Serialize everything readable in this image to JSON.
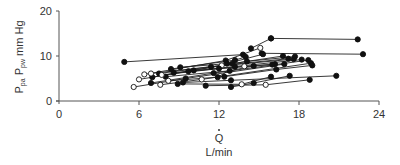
{
  "chart_data": {
    "type": "line",
    "title": "",
    "xlabel": "Q̇ L/min",
    "xlabel_symbol": "Q",
    "xlabel_unit": "L/min",
    "ylabel": "Ppa Ppw mm Hg",
    "ylabel_parts": {
      "p1": "P",
      "s1": "pa",
      "p2": " P",
      "s2": "pw",
      "unit": " mm Hg"
    },
    "xlim": [
      0,
      24
    ],
    "ylim": [
      0,
      20
    ],
    "xticks": [
      0,
      6,
      12,
      18,
      24
    ],
    "yticks": [
      0,
      10,
      20
    ],
    "grid": false,
    "legend": null,
    "marker_styles": {
      "filled": "#111111",
      "open": "#ffffff"
    },
    "series": [
      {
        "name": "subject-1",
        "points": [
          [
            4.9,
            8.7,
            "f"
          ],
          [
            13.8,
            10.3,
            "f"
          ]
        ]
      },
      {
        "name": "subject-2",
        "points": [
          [
            15.9,
            13.9,
            "f"
          ],
          [
            22.4,
            13.7,
            "f"
          ]
        ]
      },
      {
        "name": "subject-3",
        "points": [
          [
            14.4,
            11.7,
            "f"
          ],
          [
            15.9,
            13.9,
            "f"
          ]
        ]
      },
      {
        "name": "subject-4",
        "points": [
          [
            15.2,
            10.6,
            "f"
          ],
          [
            22.8,
            10.4,
            "f"
          ]
        ]
      },
      {
        "name": "subject-5",
        "points": [
          [
            6.4,
            5.9,
            "o"
          ],
          [
            12.5,
            9.0,
            "f"
          ],
          [
            15.1,
            11.8,
            "o"
          ]
        ]
      },
      {
        "name": "subject-6",
        "points": [
          [
            7.0,
            5.3,
            "f"
          ],
          [
            13.0,
            8.3,
            "f"
          ],
          [
            16.8,
            10.0,
            "f"
          ]
        ]
      },
      {
        "name": "subject-7",
        "points": [
          [
            6.9,
            6.1,
            "o"
          ],
          [
            12.2,
            7.9,
            "o"
          ],
          [
            17.2,
            9.4,
            "f"
          ]
        ]
      },
      {
        "name": "subject-8",
        "points": [
          [
            7.5,
            6.1,
            "f"
          ],
          [
            11.4,
            7.6,
            "f"
          ],
          [
            17.6,
            9.3,
            "f"
          ]
        ]
      },
      {
        "name": "subject-9",
        "points": [
          [
            6.0,
            4.8,
            "o"
          ],
          [
            9.7,
            6.6,
            "f"
          ],
          [
            18.2,
            9.2,
            "f"
          ]
        ]
      },
      {
        "name": "subject-10",
        "points": [
          [
            5.6,
            3.1,
            "o"
          ],
          [
            9.5,
            5.0,
            "f"
          ],
          [
            16.9,
            8.2,
            "f"
          ]
        ]
      },
      {
        "name": "subject-11",
        "points": [
          [
            6.9,
            4.0,
            "f"
          ],
          [
            11.6,
            6.2,
            "f"
          ],
          [
            18.7,
            9.1,
            "f"
          ]
        ]
      },
      {
        "name": "subject-12",
        "points": [
          [
            7.6,
            3.6,
            "o"
          ],
          [
            10.7,
            4.8,
            "o"
          ],
          [
            18.9,
            8.4,
            "f"
          ]
        ]
      },
      {
        "name": "subject-13",
        "points": [
          [
            8.0,
            5.4,
            "f"
          ],
          [
            12.8,
            6.7,
            "f"
          ],
          [
            14.6,
            7.8,
            "f"
          ]
        ]
      },
      {
        "name": "subject-14",
        "points": [
          [
            8.6,
            6.3,
            "f"
          ],
          [
            13.9,
            7.7,
            "o"
          ],
          [
            16.2,
            8.2,
            "f"
          ]
        ]
      },
      {
        "name": "subject-15",
        "points": [
          [
            9.1,
            7.5,
            "f"
          ],
          [
            12.6,
            8.3,
            "f"
          ],
          [
            15.3,
            10.4,
            "f"
          ]
        ]
      },
      {
        "name": "subject-16",
        "points": [
          [
            8.4,
            7.1,
            "f"
          ],
          [
            13.2,
            9.1,
            "f"
          ],
          [
            14.0,
            9.8,
            "f"
          ]
        ]
      },
      {
        "name": "subject-17",
        "points": [
          [
            7.7,
            5.8,
            "o"
          ],
          [
            12.0,
            7.2,
            "f"
          ],
          [
            16.0,
            8.1,
            "f"
          ]
        ]
      },
      {
        "name": "subject-18",
        "points": [
          [
            9.3,
            4.1,
            "f"
          ],
          [
            12.9,
            4.6,
            "f"
          ],
          [
            20.8,
            5.6,
            "f"
          ]
        ]
      },
      {
        "name": "subject-19",
        "points": [
          [
            12.4,
            5.4,
            "f"
          ],
          [
            16.3,
            7.0,
            "f"
          ],
          [
            19.0,
            7.9,
            "f"
          ]
        ]
      },
      {
        "name": "subject-20",
        "points": [
          [
            11.0,
            3.4,
            "f"
          ],
          [
            15.5,
            3.6,
            "o"
          ],
          [
            18.8,
            4.7,
            "f"
          ]
        ]
      },
      {
        "name": "subject-21",
        "points": [
          [
            12.9,
            3.1,
            "f"
          ],
          [
            14.6,
            4.0,
            "f"
          ],
          [
            17.3,
            5.6,
            "f"
          ]
        ]
      },
      {
        "name": "subject-22",
        "points": [
          [
            8.9,
            3.8,
            "f"
          ],
          [
            13.7,
            3.7,
            "o"
          ],
          [
            15.9,
            5.4,
            "f"
          ]
        ]
      },
      {
        "name": "subject-23",
        "points": [
          [
            10.1,
            6.8,
            "f"
          ],
          [
            14.1,
            8.8,
            "f"
          ],
          [
            17.7,
            9.9,
            "f"
          ]
        ]
      },
      {
        "name": "subject-24",
        "points": [
          [
            8.2,
            4.5,
            "o"
          ],
          [
            11.9,
            5.3,
            "f"
          ],
          [
            13.2,
            7.6,
            "f"
          ]
        ]
      }
    ]
  },
  "axes": {
    "x_tick_labels": [
      "0",
      "6",
      "12",
      "18",
      "24"
    ],
    "y_tick_labels": [
      "0",
      "10",
      "20"
    ],
    "x_title_symbol": "Q",
    "x_title_unit": "L/min",
    "y_title_p1": "P",
    "y_title_s1": "pa",
    "y_title_p2": " P",
    "y_title_s2": "pw",
    "y_title_unit": " mm Hg"
  }
}
